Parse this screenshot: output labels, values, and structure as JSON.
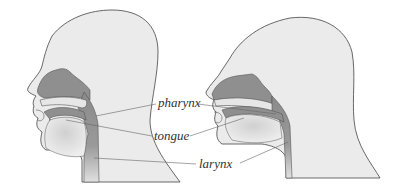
{
  "diagram": {
    "labels": {
      "pharynx": "pharynx",
      "tongue": "tongue",
      "larynx": "larynx"
    },
    "colors": {
      "skin": "#e9e9e9",
      "outline": "#444444",
      "cavity_dark": "#8a8a8a",
      "cavity_light": "#c8c8c8",
      "leader": "#666666"
    }
  }
}
